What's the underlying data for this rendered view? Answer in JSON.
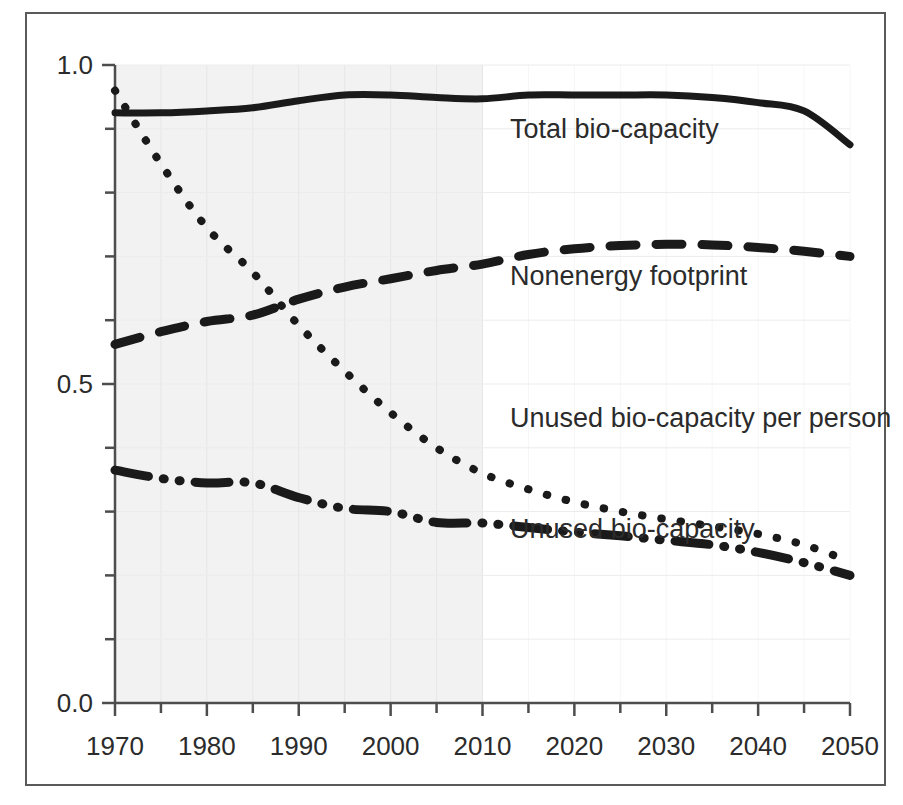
{
  "chart_data": {
    "type": "line",
    "title": "",
    "subtitle": "",
    "xlabel": "",
    "ylabel": "",
    "xlim": [
      1970,
      2050
    ],
    "ylim": [
      0.0,
      1.0
    ],
    "grid": true,
    "legend_position": "inline-annotations",
    "x_ticks": [
      "1970",
      "1980",
      "1990",
      "2000",
      "2010",
      "2020",
      "2030",
      "2040",
      "2050"
    ],
    "x_tick_values": [
      1970,
      1980,
      1990,
      2000,
      2010,
      2020,
      2030,
      2040,
      2050
    ],
    "x_minor_tick_values": [
      1975,
      1985,
      1995,
      2005,
      2015,
      2025,
      2035,
      2045
    ],
    "y_ticks": [
      "0.0",
      "0.5",
      "1.0"
    ],
    "y_tick_values": [
      0.0,
      0.5,
      1.0
    ],
    "y_minor_tick_values": [
      0.1,
      0.2,
      0.3,
      0.4,
      0.6,
      0.7,
      0.8,
      0.9
    ],
    "shaded_region": {
      "label": "historical",
      "x_from": 1970,
      "x_to": 2010,
      "color": "#f2f2f2"
    },
    "x": [
      1970,
      1975,
      1980,
      1985,
      1990,
      1995,
      2000,
      2005,
      2010,
      2015,
      2020,
      2025,
      2030,
      2035,
      2040,
      2045,
      2050
    ],
    "series": [
      {
        "name": "Total bio-capacity",
        "style": "solid",
        "color": "#1a1a1a",
        "label_x": 2013,
        "label_y": 0.885,
        "values": [
          0.925,
          0.925,
          0.928,
          0.933,
          0.944,
          0.953,
          0.953,
          0.949,
          0.947,
          0.953,
          0.953,
          0.953,
          0.953,
          0.949,
          0.941,
          0.928,
          0.875
        ]
      },
      {
        "name": "Nonenergy footprint",
        "style": "dashed",
        "color": "#1a1a1a",
        "label_x": 2013,
        "label_y": 0.655,
        "values": [
          0.562,
          0.582,
          0.598,
          0.608,
          0.633,
          0.652,
          0.665,
          0.678,
          0.688,
          0.703,
          0.712,
          0.717,
          0.719,
          0.718,
          0.714,
          0.708,
          0.7
        ]
      },
      {
        "name": "Unused bio-capacity per person",
        "style": "dotted",
        "color": "#1a1a1a",
        "label_x": 2013,
        "label_y": 0.433,
        "values": [
          0.96,
          0.845,
          0.745,
          0.675,
          0.592,
          0.52,
          0.455,
          0.4,
          0.36,
          0.335,
          0.315,
          0.3,
          0.288,
          0.277,
          0.265,
          0.248,
          0.222
        ]
      },
      {
        "name": "Unused  bio-capacity",
        "style": "dashdotdot",
        "color": "#1a1a1a",
        "label_x": 2013,
        "label_y": 0.258,
        "values": [
          0.365,
          0.352,
          0.345,
          0.345,
          0.322,
          0.305,
          0.3,
          0.283,
          0.282,
          0.275,
          0.268,
          0.262,
          0.255,
          0.248,
          0.236,
          0.22,
          0.2
        ]
      }
    ]
  }
}
